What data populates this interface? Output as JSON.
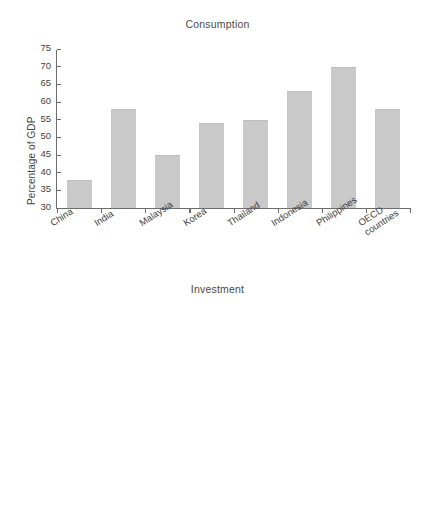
{
  "figure": {
    "background_color": "#ffffff",
    "bar_color": "#c9c9c9",
    "axis_color": "#6d6d6d",
    "text_color": "#3f3f3f"
  },
  "chart_data": [
    {
      "type": "bar",
      "title": "Consumption",
      "xlabel": "",
      "ylabel": "Percentage of GDP",
      "categories": [
        "China",
        "India",
        "Malaysia",
        "Korea",
        "Thailand",
        "Indonesia",
        "Philippines",
        "OECD countries"
      ],
      "values": [
        38,
        58,
        45,
        54,
        55,
        63,
        70,
        58
      ],
      "ylim": [
        30,
        75
      ],
      "yticks": [
        30,
        35,
        40,
        45,
        50,
        55,
        60,
        65,
        70,
        75
      ],
      "ytick_labels": [
        "30",
        "35",
        "40",
        "45",
        "50",
        "55",
        "60",
        "65",
        "70",
        "75"
      ],
      "grid": false,
      "legend": "none"
    },
    {
      "type": "bar",
      "title": "Investment",
      "xlabel": "",
      "ylabel": "Percentage of GDP",
      "categories": [
        "China",
        "India",
        "Malaysia",
        "Korea",
        "Thailand",
        "Indonesia",
        "Philippines",
        "OECD countries"
      ],
      "values": [
        44,
        33,
        21,
        29,
        27,
        25,
        16,
        21
      ],
      "ylim": [
        10,
        50
      ],
      "yticks": [
        10,
        15,
        20,
        25,
        30,
        35,
        40,
        45,
        50
      ],
      "ytick_labels": [
        "10",
        "15",
        "20",
        "25",
        "30",
        "35",
        "40",
        "45",
        "50"
      ],
      "grid": false,
      "legend": "none"
    }
  ],
  "charts": [
    {
      "id": "consumption",
      "title": "Consumption",
      "ylabel": "Percentage of GDP",
      "ytick_labels": [
        "75",
        "70",
        "65",
        "60",
        "55",
        "50",
        "45",
        "40",
        "35",
        "30"
      ],
      "xtick_labels": [
        {
          "line1": "China",
          "line2": ""
        },
        {
          "line1": "India",
          "line2": ""
        },
        {
          "line1": "Malaysia",
          "line2": ""
        },
        {
          "line1": "Korea",
          "line2": ""
        },
        {
          "line1": "Thailand",
          "line2": ""
        },
        {
          "line1": "Indonesia",
          "line2": ""
        },
        {
          "line1": "Philippines",
          "line2": ""
        },
        {
          "line1": "OECD",
          "line2": "countries"
        }
      ]
    },
    {
      "id": "investment",
      "title": "Investment",
      "ylabel": "Percentage of GDP",
      "ytick_labels": [
        "50",
        "45",
        "40",
        "35",
        "30",
        "25",
        "20",
        "15",
        "10"
      ],
      "xtick_labels": [
        {
          "line1": "China",
          "line2": ""
        },
        {
          "line1": "India",
          "line2": ""
        },
        {
          "line1": "Malaysia",
          "line2": ""
        },
        {
          "line1": "Korea",
          "line2": ""
        },
        {
          "line1": "Thailand",
          "line2": ""
        },
        {
          "line1": "Indonesia",
          "line2": ""
        },
        {
          "line1": "Philippines",
          "line2": ""
        },
        {
          "line1": "OECD",
          "line2": "countries"
        }
      ]
    }
  ]
}
